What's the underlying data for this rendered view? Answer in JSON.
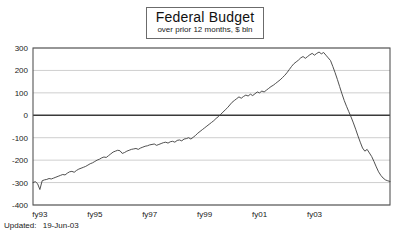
{
  "footer": {
    "label": "Updated:",
    "value": "19-Jun-03"
  },
  "chart_data": {
    "type": "line",
    "title": "Federal Budget",
    "subtitle": "over prior 12 months, $ bln",
    "xlabel": "",
    "ylabel": "",
    "ylim": [
      -400,
      300
    ],
    "yticks": [
      300,
      200,
      100,
      0,
      -100,
      -200,
      -300,
      -400
    ],
    "ytick_labels": [
      "300",
      "200",
      "100",
      "0",
      "-100",
      "-200",
      "-300",
      "-400"
    ],
    "xticks": [
      3,
      27,
      51,
      75,
      99,
      123
    ],
    "xtick_labels": [
      "fy93",
      "fy95",
      "fy97",
      "fy99",
      "fy01",
      "fy03"
    ],
    "grid": true,
    "zero_line": true,
    "legend": null,
    "x_count": 129,
    "series": [
      {
        "name": "Federal Budget, trailing 12 months",
        "units": "$ bln",
        "values": [
          -300,
          -296,
          -305,
          -331,
          -292,
          -288,
          -286,
          -282,
          -284,
          -280,
          -276,
          -272,
          -268,
          -264,
          -266,
          -258,
          -252,
          -250,
          -254,
          -246,
          -240,
          -236,
          -232,
          -228,
          -222,
          -216,
          -212,
          -206,
          -200,
          -196,
          -190,
          -186,
          -188,
          -180,
          -172,
          -164,
          -160,
          -156,
          -158,
          -170,
          -166,
          -160,
          -156,
          -152,
          -150,
          -148,
          -152,
          -146,
          -142,
          -138,
          -136,
          -132,
          -130,
          -128,
          -134,
          -130,
          -126,
          -122,
          -120,
          -124,
          -118,
          -116,
          -120,
          -112,
          -110,
          -114,
          -106,
          -104,
          -100,
          -106,
          -98,
          -90,
          -80,
          -72,
          -64,
          -56,
          -48,
          -40,
          -32,
          -24,
          -14,
          -6,
          4,
          14,
          24,
          34,
          46,
          58,
          66,
          74,
          82,
          76,
          84,
          90,
          86,
          94,
          88,
          96,
          104,
          100,
          108,
          104,
          112,
          120,
          128,
          134,
          142,
          150,
          158,
          168,
          178,
          190,
          204,
          218,
          230,
          238,
          246,
          256,
          262,
          254,
          262,
          270,
          276,
          268,
          276,
          282,
          274,
          280,
          268,
          256,
          244
        ]
      },
      {
        "name": "Federal Budget, trailing 12 months (continued)",
        "units": "$ bln",
        "values": [
          244,
          218,
          190,
          160,
          128,
          96,
          66,
          40,
          16,
          -8,
          -34,
          -62,
          -92,
          -120,
          -146,
          -160,
          -152,
          -168,
          -184,
          -206,
          -230,
          -252,
          -268,
          -280,
          -288,
          -292,
          -295
        ]
      }
    ],
    "notes": {
      "start_period": "fy93",
      "end_period": "fy03",
      "peak_value": 282,
      "trough_value": -331,
      "final_value": -295
    }
  }
}
